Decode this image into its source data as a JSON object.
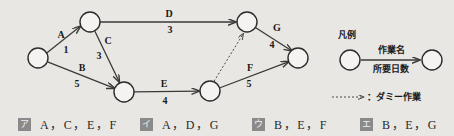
{
  "figure": {
    "type": "pert-cpm-arrow-diagram",
    "nodes": [
      {
        "id": "n1",
        "label": "",
        "cx": 38,
        "cy": 58,
        "r": 10
      },
      {
        "id": "n2",
        "label": "",
        "cx": 90,
        "cy": 22,
        "r": 10
      },
      {
        "id": "n3",
        "label": "",
        "cx": 124,
        "cy": 92,
        "r": 10
      },
      {
        "id": "n4",
        "label": "",
        "cx": 247,
        "cy": 22,
        "r": 10
      },
      {
        "id": "n5",
        "label": "",
        "cx": 210,
        "cy": 91,
        "r": 10
      },
      {
        "id": "n6",
        "label": "",
        "cx": 298,
        "cy": 58,
        "r": 10
      }
    ],
    "edges": [
      {
        "name": "A",
        "days": "1",
        "from": "n1",
        "to": "n2",
        "dummy": false
      },
      {
        "name": "B",
        "days": "5",
        "from": "n1",
        "to": "n3",
        "dummy": false
      },
      {
        "name": "C",
        "days": "3",
        "from": "n2",
        "to": "n3",
        "dummy": false
      },
      {
        "name": "D",
        "days": "3",
        "from": "n2",
        "to": "n4",
        "dummy": false
      },
      {
        "name": "E",
        "days": "4",
        "from": "n3",
        "to": "n5",
        "dummy": false
      },
      {
        "name": "F",
        "days": "5",
        "from": "n5",
        "to": "n6",
        "dummy": false
      },
      {
        "name": "G",
        "days": "4",
        "from": "n4",
        "to": "n6",
        "dummy": false
      },
      {
        "name": "",
        "days": "",
        "from": "n5",
        "to": "n4",
        "dummy": true
      }
    ],
    "edge_labels": {
      "A": {
        "name": "A",
        "name_x": 61,
        "name_y": 38,
        "days": "1",
        "days_x": 66,
        "days_y": 53
      },
      "B": {
        "name": "B",
        "name_x": 82,
        "name_y": 71,
        "days": "5",
        "days_x": 77,
        "days_y": 87
      },
      "C": {
        "name": "C",
        "name_x": 108,
        "name_y": 44,
        "days": "3",
        "days_x": 99,
        "days_y": 59
      },
      "D": {
        "name": "D",
        "name_x": 169,
        "name_y": 17,
        "days": "3",
        "days_x": 170,
        "days_y": 33
      },
      "E": {
        "name": "E",
        "name_x": 164,
        "name_y": 87,
        "days": "4",
        "days_x": 165,
        "days_y": 104
      },
      "F": {
        "name": "F",
        "name_x": 250,
        "name_y": 71,
        "days": "5",
        "days_x": 249,
        "days_y": 87
      },
      "G": {
        "name": "G",
        "name_x": 277,
        "name_y": 31,
        "days": "4",
        "days_x": 272,
        "days_y": 48
      }
    }
  },
  "legend": {
    "title": "凡例",
    "title_x": 338,
    "title_y": 38,
    "task_name_label": "作業名",
    "task_name_x": 391,
    "task_name_y": 53,
    "duration_label": "所要日数",
    "duration_x": 391,
    "duration_y": 72,
    "dummy_label": "：ダミー作業",
    "dummy_label_x": 367,
    "dummy_label_y": 100,
    "node_left": {
      "cx": 350,
      "cy": 60,
      "r": 10
    },
    "node_right": {
      "cx": 432,
      "cy": 60,
      "r": 10
    }
  },
  "options": [
    {
      "marker": "ア",
      "text": "A，C，E，F"
    },
    {
      "marker": "イ",
      "text": "A，D，G"
    },
    {
      "marker": "ウ",
      "text": "B，E，F"
    },
    {
      "marker": "エ",
      "text": "B，E，G"
    }
  ],
  "colors": {
    "background": "#e8e7e3",
    "ink": "#2b2b2b",
    "node_fill": "#f4f3f1",
    "marker_bg": "#8a8a8a",
    "marker_fg": "#f2f2f2"
  }
}
